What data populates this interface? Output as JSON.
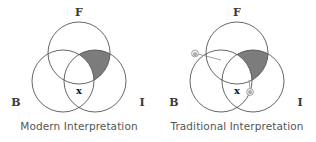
{
  "figure": {
    "background_color": "#ffffff",
    "stroke_color": "#555555",
    "shade_color": "#7c7c7c",
    "label_color": "#3a3a3a",
    "caption_color": "#555555",
    "marker_color": "#888888"
  },
  "panels": [
    {
      "id": "modern",
      "caption": "Modern Interpretation",
      "sets": [
        {
          "key": "F",
          "label": "F",
          "position": "top"
        },
        {
          "key": "B",
          "label": "B",
          "position": "bottom-left"
        },
        {
          "key": "I",
          "label": "I",
          "position": "bottom-right"
        }
      ],
      "shaded_region": "F ∩ I",
      "point_markers": [
        {
          "label": "x",
          "region": "B ∩ I"
        }
      ],
      "annotation_markers": []
    },
    {
      "id": "traditional",
      "caption": "Traditional Interpretation",
      "sets": [
        {
          "key": "F",
          "label": "F",
          "position": "top"
        },
        {
          "key": "B",
          "label": "B",
          "position": "bottom-left"
        },
        {
          "key": "I",
          "label": "I",
          "position": "bottom-right"
        }
      ],
      "shaded_region": "F ∩ I",
      "point_markers": [
        {
          "label": "x",
          "region": "B ∩ I"
        }
      ],
      "annotation_markers": [
        {
          "glyph": "⊗",
          "position": "upper-left-arc"
        },
        {
          "glyph": "⊗",
          "position": "lower-right-arc"
        }
      ]
    }
  ]
}
